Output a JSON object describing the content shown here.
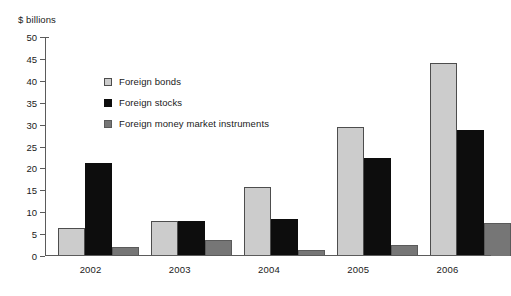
{
  "chart_data": {
    "type": "bar",
    "title": "",
    "subtitle": "",
    "xlabel": "",
    "ylabel": "$ billions",
    "unit_label": "$ billions",
    "categories": [
      "2002",
      "2003",
      "2004",
      "2005",
      "2006"
    ],
    "series": [
      {
        "name": "Foreign bonds",
        "color": "#cccccc",
        "values": [
          6.3,
          8.1,
          15.8,
          29.5,
          44.1
        ]
      },
      {
        "name": "Foreign stocks",
        "color": "#0d0d0d",
        "values": [
          21.2,
          7.9,
          8.4,
          22.4,
          28.7
        ]
      },
      {
        "name": "Foreign money market instruments",
        "color": "#767676",
        "values": [
          2.1,
          3.7,
          1.4,
          2.6,
          7.6
        ]
      }
    ],
    "ylim": [
      0,
      50
    ],
    "yticks": [
      0,
      5,
      10,
      15,
      20,
      25,
      30,
      35,
      40,
      45,
      50
    ],
    "ytick_labels": [
      "0",
      "5",
      "10",
      "15",
      "20",
      "25",
      "30",
      "35",
      "40",
      "45",
      "50"
    ],
    "grid": false,
    "legend_position": "inside-upper-left",
    "legend": [
      "Foreign bonds",
      "Foreign stocks",
      "Foreign money market instruments"
    ]
  }
}
